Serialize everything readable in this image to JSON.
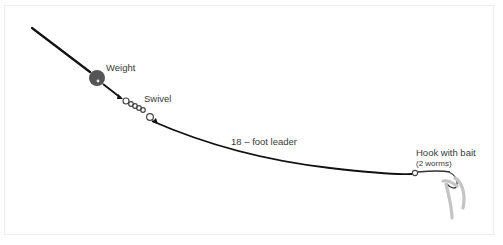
{
  "diagram": {
    "type": "fishing-rig-illustration",
    "labels": {
      "weight": "Weight",
      "swivel": "Swivel",
      "leader": "18 – foot leader",
      "hook": "Hook with bait",
      "bait_note": "(2 worms)"
    },
    "colors": {
      "line": "#111111",
      "weight": "#555555",
      "worm": "#c8c8c8",
      "text": "#3a3a3a",
      "frame": "#ececec"
    }
  }
}
